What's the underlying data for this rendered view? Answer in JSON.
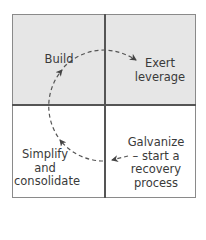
{
  "diagram": {
    "type": "2x2 matrix with cyclic process arrow",
    "colors": {
      "shaded_quadrant": "#e6e6e6",
      "white_quadrant": "#ffffff",
      "grid_line": "#555555",
      "frame": "#8a8a8a",
      "arrow": "#555555",
      "text": "#3a3a3a"
    },
    "quadrants": [
      {
        "position": "top-left",
        "label": "Build",
        "shaded": true
      },
      {
        "position": "top-right",
        "label_line1": "Exert",
        "label_line2": "leverage",
        "shaded": true
      },
      {
        "position": "bottom-left",
        "label_line1": "Simplify",
        "label_line2": "and",
        "label_line3": "consolidate",
        "shaded": false
      },
      {
        "position": "bottom-right",
        "label_line1": "Galvanize",
        "label_line2": "– start a",
        "label_line3": "recovery process",
        "shaded": false
      }
    ],
    "flow": [
      "Galvanize – start a recovery process",
      "Simplify and consolidate",
      "Build",
      "Exert leverage"
    ]
  }
}
